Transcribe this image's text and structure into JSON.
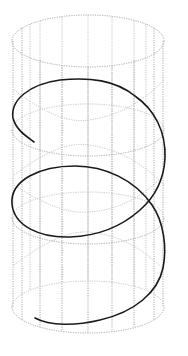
{
  "figure": {
    "colors": {
      "background": "#ffffff",
      "wireframe": "#a8a8a8",
      "wireframe_back": "#c4c4c4",
      "helix": "#1a1a1a"
    },
    "cylinder": {
      "center_x": 88,
      "rx": 76,
      "ry": 26,
      "ring_centers_y": [
        41,
        130,
        218,
        307
      ],
      "vertical_lines_x": [
        14,
        24,
        40,
        62,
        88,
        112,
        134,
        152,
        162
      ]
    },
    "helix": {
      "turns": 2,
      "start_point": [
        34,
        142
      ],
      "end_point": [
        35,
        318
      ],
      "crossing_point": [
        150,
        203
      ]
    }
  }
}
